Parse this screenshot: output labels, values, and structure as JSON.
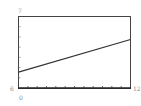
{
  "chart_data": {
    "type": "line",
    "title": "",
    "xlabel": "",
    "ylabel": "",
    "xlim": [
      0,
      12
    ],
    "ylim": [
      0,
      7
    ],
    "x_min_label": "0",
    "x_max_label": "12",
    "y_max_label": "7",
    "y_left_label": "6",
    "x_ticks": [
      1,
      2,
      3,
      4,
      5,
      6,
      7,
      8,
      9,
      10,
      11
    ],
    "y_ticks": [
      1,
      2,
      3,
      4,
      5,
      6
    ],
    "grid": false,
    "series": [
      {
        "name": "line",
        "x": [
          0,
          12
        ],
        "y": [
          1.55,
          4.75
        ]
      }
    ]
  }
}
